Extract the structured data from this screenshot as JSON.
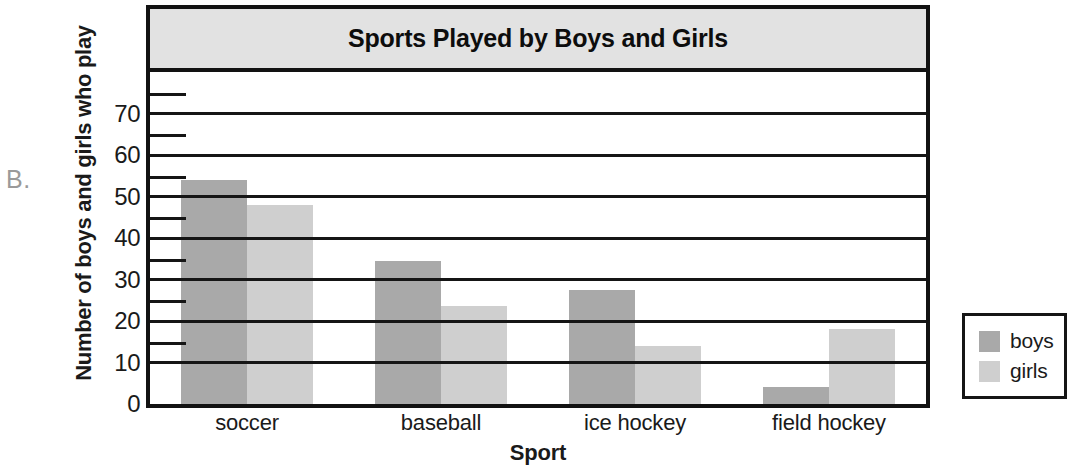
{
  "figure": {
    "label": "B."
  },
  "chart_data": {
    "type": "bar",
    "title": "Sports Played by Boys and Girls",
    "xlabel": "Sport",
    "ylabel": "Number of boys and girls who play",
    "categories": [
      "soccer",
      "baseball",
      "ice hockey",
      "field hockey"
    ],
    "series": [
      {
        "name": "boys",
        "color": "#a9a9a9",
        "values": [
          54,
          34.5,
          27.5,
          4
        ]
      },
      {
        "name": "girls",
        "color": "#cfcfcf",
        "values": [
          48,
          23.5,
          14,
          18
        ]
      }
    ],
    "ylim": [
      0,
      80
    ],
    "yticks": [
      0,
      10,
      20,
      30,
      40,
      50,
      60,
      70
    ],
    "ytick_labels": [
      "0",
      "10",
      "20",
      "30",
      "40",
      "50",
      "60",
      "70"
    ],
    "grid": true,
    "legend_position": "right-outside",
    "legend_entries": [
      "boys",
      "girls"
    ]
  }
}
